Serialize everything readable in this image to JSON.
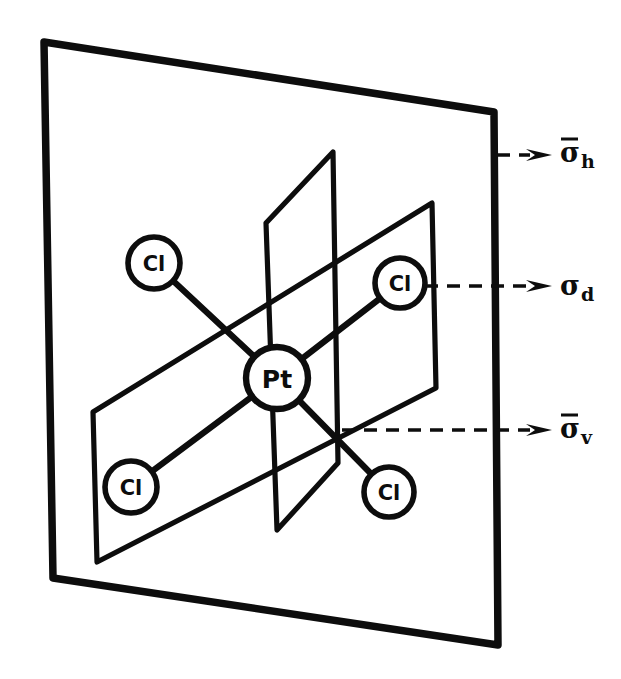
{
  "figure": {
    "kind": "molecular-symmetry-diagram",
    "line_color": "#0d0d0d",
    "background_color": "#ffffff"
  },
  "center_atom": {
    "label": "Pt",
    "cx": 277,
    "cy": 378,
    "r": 31
  },
  "ligands": [
    {
      "id": "cl-upper-left",
      "label": "Cl",
      "cx": 154,
      "cy": 263,
      "r": 26
    },
    {
      "id": "cl-upper-right",
      "label": "Cl",
      "cx": 400,
      "cy": 283,
      "r": 25
    },
    {
      "id": "cl-lower-left",
      "label": "Cl",
      "cx": 131,
      "cy": 487,
      "r": 26
    },
    {
      "id": "cl-lower-right",
      "label": "Cl",
      "cx": 389,
      "cy": 492,
      "r": 25
    }
  ],
  "bonds": [
    {
      "id": "bond-pt-cl-upper-left",
      "x1": 277,
      "y1": 378,
      "x2": 154,
      "y2": 263
    },
    {
      "id": "bond-pt-cl-upper-right",
      "x1": 277,
      "y1": 378,
      "x2": 400,
      "y2": 283
    },
    {
      "id": "bond-pt-cl-lower-left",
      "x1": 277,
      "y1": 378,
      "x2": 131,
      "y2": 487
    },
    {
      "id": "bond-pt-cl-lower-right",
      "x1": 277,
      "y1": 378,
      "x2": 389,
      "y2": 492
    }
  ],
  "planes": {
    "outer": {
      "id": "sigma-h-plane",
      "name": "outer vertical plane",
      "points": "44,42 494,112 498,645 53,578"
    },
    "horizontal": {
      "id": "sigma-d-plane",
      "name": "horizontal plane through ligands",
      "points": "93,412 432,203 436,388 97,562"
    },
    "vertical_inner": {
      "id": "sigma-v-plane",
      "name": "inner vertical plane",
      "points": "266,223 333,152 338,463 277,530"
    }
  },
  "annotations": [
    {
      "id": "sigma-h",
      "symbol": "σ",
      "subscript": "h",
      "overbar": true,
      "leader": {
        "x1": 497,
        "y1": 155,
        "x2": 552,
        "y2": 155
      },
      "label_x": 560,
      "label_y": 152
    },
    {
      "id": "sigma-d",
      "symbol": "σ",
      "subscript": "d",
      "overbar": false,
      "leader": {
        "x1": 425,
        "y1": 286,
        "x2": 552,
        "y2": 286
      },
      "label_x": 560,
      "label_y": 285
    },
    {
      "id": "sigma-v",
      "symbol": "σ",
      "subscript": "v",
      "overbar": true,
      "leader": {
        "x1": 342,
        "y1": 430,
        "x2": 552,
        "y2": 430
      },
      "label_x": 560,
      "label_y": 428
    }
  ]
}
